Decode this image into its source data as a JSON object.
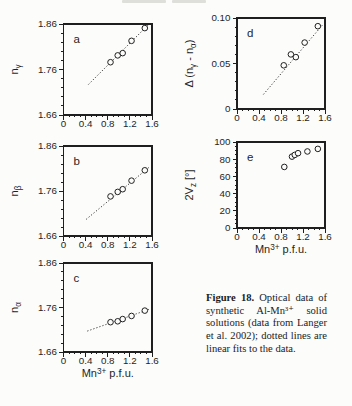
{
  "caption": {
    "label": "Figure 18.",
    "body": "Optical data of synthetic Al-Mn³⁺ solid solutions (data from Langer et al. 2002); dotted lines are linear fits to the data."
  },
  "colors": {
    "ink": "#1f1f1f",
    "paper": "#fcfcfb"
  },
  "chart_data": [
    {
      "id": "a",
      "type": "scatter",
      "panel_letter": "a",
      "x": [
        0.85,
        0.98,
        1.07,
        1.23,
        1.47
      ],
      "y": [
        1.776,
        1.791,
        1.796,
        1.823,
        1.851
      ],
      "fit_line": {
        "x1": 0.45,
        "y1": 1.727,
        "x2": 1.54,
        "y2": 1.859
      },
      "xlim": [
        0,
        1.6
      ],
      "ylim": [
        1.66,
        1.86
      ],
      "xticks": [
        0,
        0.4,
        0.8,
        1.2,
        1.6
      ],
      "xtick_labels": [
        "0",
        "0.4",
        "0.8",
        "1.2",
        "1.6"
      ],
      "yticks": [
        1.66,
        1.76,
        1.86
      ],
      "ytick_labels": [
        "1.66",
        "1.76",
        "1.86"
      ],
      "x_minor": 0.1,
      "y_minor": 0.02,
      "ylabel": [
        {
          "t": "n"
        },
        {
          "t": "γ",
          "s": "sub"
        }
      ],
      "xlabel": null
    },
    {
      "id": "b",
      "type": "scatter",
      "panel_letter": "b",
      "x": [
        0.85,
        0.98,
        1.07,
        1.23,
        1.47
      ],
      "y": [
        1.748,
        1.758,
        1.764,
        1.783,
        1.806
      ],
      "fit_line": {
        "x1": 0.41,
        "y1": 1.697,
        "x2": 1.55,
        "y2": 1.813
      },
      "xlim": [
        0,
        1.6
      ],
      "ylim": [
        1.66,
        1.86
      ],
      "xticks": [
        0,
        0.4,
        0.8,
        1.2,
        1.6
      ],
      "xtick_labels": [
        "0",
        "0.4",
        "0.8",
        "1.2",
        "1.6"
      ],
      "yticks": [
        1.66,
        1.76,
        1.86
      ],
      "ytick_labels": [
        "1.66",
        "1.76",
        "1.86"
      ],
      "x_minor": 0.1,
      "y_minor": 0.02,
      "ylabel": [
        {
          "t": "n"
        },
        {
          "t": "β",
          "s": "sub"
        }
      ],
      "xlabel": null
    },
    {
      "id": "c",
      "type": "scatter",
      "panel_letter": "c",
      "x": [
        0.85,
        0.98,
        1.07,
        1.23,
        1.47
      ],
      "y": [
        1.727,
        1.729,
        1.734,
        1.741,
        1.753
      ],
      "fit_line": {
        "x1": 0.43,
        "y1": 1.707,
        "x2": 1.55,
        "y2": 1.756
      },
      "xlim": [
        0,
        1.6
      ],
      "ylim": [
        1.66,
        1.86
      ],
      "xticks": [
        0,
        0.4,
        0.8,
        1.2,
        1.6
      ],
      "xtick_labels": [
        "0",
        "0.4",
        "0.8",
        "1.2",
        "1.6"
      ],
      "yticks": [
        1.66,
        1.76,
        1.86
      ],
      "ytick_labels": [
        "1.66",
        "1.76",
        "1.86"
      ],
      "x_minor": 0.1,
      "y_minor": 0.02,
      "ylabel": [
        {
          "t": "n"
        },
        {
          "t": "α",
          "s": "sub"
        }
      ],
      "xlabel": [
        {
          "t": "Mn"
        },
        {
          "t": "3+",
          "s": "sup"
        },
        {
          "t": " p.f.u."
        }
      ]
    },
    {
      "id": "d",
      "type": "scatter",
      "panel_letter": "d",
      "x": [
        0.85,
        0.98,
        1.07,
        1.23,
        1.47
      ],
      "y": [
        0.048,
        0.06,
        0.057,
        0.073,
        0.091
      ],
      "fit_line": {
        "x1": 0.48,
        "y1": 0.016,
        "x2": 1.55,
        "y2": 0.092
      },
      "xlim": [
        0,
        1.6
      ],
      "ylim": [
        0,
        0.1
      ],
      "xticks": [
        0,
        0.4,
        0.8,
        1.2,
        1.6
      ],
      "xtick_labels": [
        "0",
        "0.4",
        "0.8",
        "1.2",
        "1.6"
      ],
      "yticks": [
        0,
        0.05,
        0.1
      ],
      "ytick_labels": [
        "0",
        "0.05",
        "0.10"
      ],
      "x_minor": 0.1,
      "y_minor": 0.01,
      "ylabel": [
        {
          "t": "Δ (n"
        },
        {
          "t": "γ",
          "s": "sub"
        },
        {
          "t": " - n"
        },
        {
          "t": "α",
          "s": "sub"
        },
        {
          "t": ")"
        }
      ],
      "xlabel": null
    },
    {
      "id": "e",
      "type": "scatter",
      "panel_letter": "e",
      "x": [
        0.86,
        1.0,
        1.05,
        1.11,
        1.28,
        1.47
      ],
      "y": [
        71,
        83,
        85,
        87,
        89,
        92
      ],
      "fit_line": null,
      "xlim": [
        0,
        1.6
      ],
      "ylim": [
        0,
        100
      ],
      "xticks": [
        0,
        0.4,
        0.8,
        1.2,
        1.6
      ],
      "xtick_labels": [
        "0",
        "0.4",
        "0.8",
        "1.2",
        "1.6"
      ],
      "yticks": [
        0,
        20,
        40,
        60,
        80,
        100
      ],
      "ytick_labels": [
        "0",
        "20",
        "40",
        "60",
        "80",
        "100"
      ],
      "x_minor": 0.1,
      "y_minor": 5,
      "ylabel": [
        {
          "t": "2V"
        },
        {
          "t": "z",
          "s": "sub"
        },
        {
          "t": " [°]"
        }
      ],
      "xlabel": [
        {
          "t": "Mn"
        },
        {
          "t": "3+",
          "s": "sup"
        },
        {
          "t": " p.f.u."
        }
      ]
    }
  ]
}
